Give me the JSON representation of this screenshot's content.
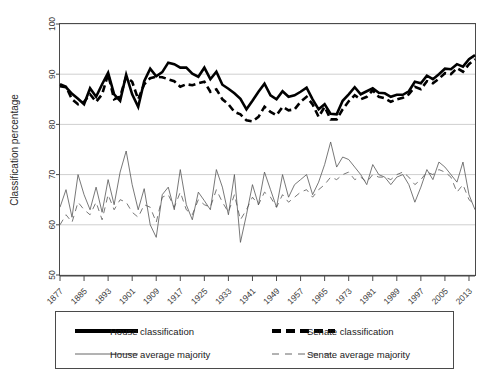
{
  "chart_data": {
    "type": "line",
    "title": "",
    "xlabel": "",
    "ylabel": "Classification percentage",
    "xlim": [
      1877,
      2015
    ],
    "ylim": [
      50,
      100
    ],
    "grid": true,
    "legend_position": "bottom",
    "y_ticks": [
      50,
      60,
      70,
      80,
      90,
      100
    ],
    "x_ticks": [
      1877,
      1885,
      1893,
      1901,
      1909,
      1917,
      1925,
      1933,
      1941,
      1949,
      1957,
      1965,
      1973,
      1981,
      1989,
      1997,
      2005,
      2013
    ],
    "x": [
      1877,
      1879,
      1881,
      1883,
      1885,
      1887,
      1889,
      1891,
      1893,
      1895,
      1897,
      1899,
      1901,
      1903,
      1905,
      1907,
      1909,
      1911,
      1913,
      1915,
      1917,
      1919,
      1921,
      1923,
      1925,
      1927,
      1929,
      1931,
      1933,
      1935,
      1937,
      1939,
      1941,
      1943,
      1945,
      1947,
      1949,
      1951,
      1953,
      1955,
      1957,
      1959,
      1961,
      1963,
      1965,
      1967,
      1969,
      1971,
      1973,
      1975,
      1977,
      1979,
      1981,
      1983,
      1985,
      1987,
      1989,
      1991,
      1993,
      1995,
      1997,
      1999,
      2001,
      2003,
      2005,
      2007,
      2009,
      2011,
      2013,
      2015
    ],
    "series": [
      {
        "name": "House classification",
        "style": "solid-thick",
        "color": "#000000",
        "values": [
          87.6,
          87.4,
          86.1,
          85.1,
          84.0,
          87.2,
          85.5,
          88.0,
          90.3,
          86.0,
          84.7,
          89.9,
          86.0,
          83.5,
          88.6,
          91.1,
          89.6,
          90.4,
          92.3,
          92.0,
          91.3,
          91.3,
          90.1,
          89.5,
          91.3,
          89.0,
          90.5,
          87.9,
          87.1,
          86.2,
          85.1,
          83.0,
          84.7,
          86.5,
          88.1,
          85.8,
          85.0,
          86.6,
          85.5,
          85.8,
          86.5,
          87.3,
          85.0,
          83.0,
          84.0,
          82.1,
          82.0,
          84.7,
          86.0,
          87.4,
          86.0,
          86.6,
          87.2,
          86.3,
          86.2,
          85.5,
          85.9,
          85.9,
          86.6,
          88.5,
          88.2,
          89.7,
          89.0,
          90.0,
          91.1,
          91.0,
          92.0,
          91.5,
          93.0,
          93.8
        ]
      },
      {
        "name": "Senate classification",
        "style": "dashed-thick",
        "color": "#000000",
        "values": [
          88.0,
          87.5,
          85.0,
          84.0,
          84.5,
          86.0,
          84.5,
          86.0,
          90.0,
          85.0,
          85.5,
          89.5,
          88.5,
          85.0,
          88.0,
          89.2,
          89.5,
          89.4,
          89.0,
          88.6,
          87.5,
          88.0,
          87.8,
          88.2,
          88.5,
          86.5,
          87.0,
          85.0,
          84.0,
          82.5,
          82.0,
          80.8,
          80.6,
          81.5,
          83.5,
          82.5,
          81.8,
          83.5,
          82.8,
          83.0,
          84.5,
          85.5,
          84.0,
          81.5,
          83.5,
          81.0,
          81.0,
          83.0,
          84.6,
          85.8,
          85.0,
          85.5,
          86.8,
          85.5,
          85.2,
          84.5,
          85.0,
          85.3,
          86.0,
          87.5,
          87.0,
          88.6,
          88.2,
          89.1,
          90.2,
          90.0,
          91.2,
          90.5,
          92.0,
          93.0
        ]
      },
      {
        "name": "House average majority",
        "style": "solid-thin",
        "color": "#555555",
        "values": [
          63.5,
          67.0,
          61.5,
          70.0,
          66.0,
          63.0,
          67.5,
          62.5,
          69.0,
          64.0,
          70.5,
          74.7,
          68.0,
          63.0,
          67.2,
          60.0,
          57.5,
          66.0,
          67.5,
          63.0,
          71.0,
          64.0,
          61.0,
          66.5,
          64.8,
          63.0,
          71.0,
          67.5,
          62.0,
          70.0,
          56.5,
          62.0,
          68.0,
          64.0,
          70.5,
          67.0,
          63.5,
          70.0,
          65.5,
          68.0,
          69.0,
          70.0,
          66.0,
          68.5,
          72.0,
          76.5,
          71.5,
          73.5,
          73.0,
          71.5,
          70.0,
          68.0,
          72.0,
          70.0,
          69.5,
          68.0,
          69.5,
          70.0,
          68.0,
          64.5,
          67.5,
          71.0,
          69.0,
          72.5,
          71.5,
          70.0,
          68.5,
          72.5,
          66.0,
          63.0
        ]
      },
      {
        "name": "Senate average majority",
        "style": "dashed-thin",
        "color": "#555555",
        "values": [
          60.0,
          62.0,
          60.5,
          64.5,
          63.0,
          62.0,
          64.5,
          61.0,
          66.0,
          63.0,
          65.0,
          64.5,
          62.5,
          61.5,
          64.0,
          63.5,
          60.5,
          65.5,
          66.0,
          63.5,
          66.5,
          63.0,
          62.0,
          65.0,
          64.0,
          63.5,
          67.0,
          64.5,
          62.5,
          66.0,
          61.0,
          63.0,
          65.5,
          64.0,
          66.5,
          65.5,
          63.5,
          66.0,
          64.5,
          65.5,
          66.5,
          67.0,
          65.5,
          67.0,
          68.0,
          69.5,
          69.0,
          70.0,
          70.5,
          69.0,
          69.5,
          68.5,
          70.0,
          69.5,
          69.5,
          69.0,
          70.0,
          70.5,
          69.5,
          68.0,
          69.0,
          70.5,
          70.0,
          71.0,
          70.5,
          69.5,
          66.5,
          68.0,
          65.0,
          64.0
        ]
      }
    ],
    "legend": [
      {
        "label": "House classification",
        "style": "solid-thick"
      },
      {
        "label": "Senate classification",
        "style": "dashed-thick"
      },
      {
        "label": "House average majority",
        "style": "solid-thin"
      },
      {
        "label": "Senate average majority",
        "style": "dashed-thin"
      }
    ]
  }
}
